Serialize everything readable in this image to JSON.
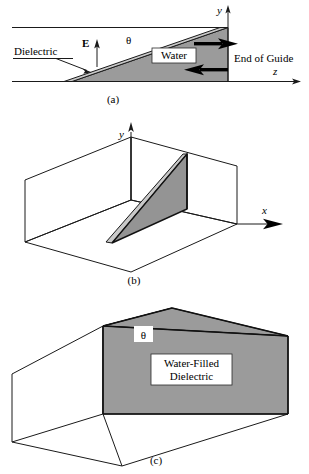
{
  "figure": {
    "colors": {
      "water_fill": "#9b9b9b",
      "dielectric_fill": "#c9c9c9",
      "line": "#1a1a1a",
      "label_box": "#ffffff",
      "background": "#ffffff"
    }
  },
  "panels": [
    {
      "id": "a",
      "caption": "(a)",
      "view": "side view, y-z cross section",
      "labels": {
        "dielectric": "Dielectric",
        "field": "E",
        "angle": "θ",
        "material": "Water",
        "end_of_guide": "End of Guide"
      },
      "axes": [
        {
          "name": "y",
          "label": "y",
          "direction": "up"
        },
        {
          "name": "z",
          "label": "z",
          "direction": "right"
        }
      ],
      "arrows": {
        "incident": "right",
        "reflected": "left"
      }
    },
    {
      "id": "b",
      "caption": "(b)",
      "view": "three-dimensional open waveguide with wedge",
      "labels": {},
      "axes": [
        {
          "name": "y",
          "label": "y",
          "direction": "up"
        },
        {
          "name": "x",
          "label": "x",
          "direction": "right"
        }
      ]
    },
    {
      "id": "c",
      "caption": "(c)",
      "view": "three-dimensional filled wedge",
      "labels": {
        "angle": "θ",
        "material_line1": "Water-Filled",
        "material_line2": "Dielectric"
      },
      "axes": []
    }
  ]
}
